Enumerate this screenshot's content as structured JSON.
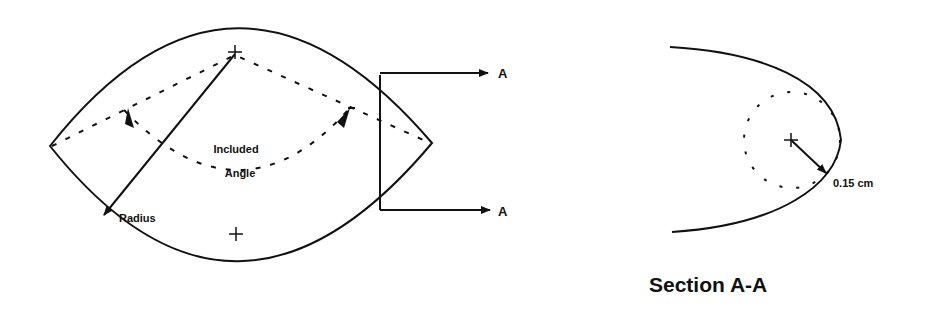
{
  "main_view": {
    "labels": {
      "radius": "Radius",
      "included_angle_line1": "Included",
      "included_angle_line2": "Angle",
      "section_marker_top": "A",
      "section_marker_bottom": "A"
    }
  },
  "section_view": {
    "title": "Section A-A",
    "dimension": "0.15 cm"
  },
  "colors": {
    "line": "#111111",
    "background": "#ffffff"
  }
}
